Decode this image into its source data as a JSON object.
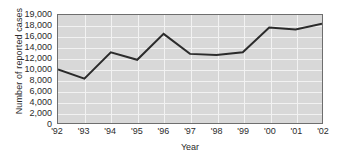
{
  "chart_data": {
    "type": "line",
    "title": "",
    "xlabel": "Year",
    "ylabel": "Number of reported cases",
    "categories": [
      "'92",
      "'93",
      "'94",
      "'95",
      "'96",
      "'97",
      "'98",
      "'99",
      "'00",
      "'01",
      "'02"
    ],
    "values": [
      9900,
      8200,
      13100,
      11700,
      16500,
      12800,
      12600,
      13100,
      17700,
      17300,
      18200
    ],
    "series": [
      {
        "name": "Number of reported cases",
        "values": [
          9900,
          8200,
          13100,
          11700,
          16500,
          12800,
          12600,
          13100,
          17700,
          17300,
          18200
        ]
      }
    ],
    "ytick_labels": [
      "19,000",
      "18,000",
      "16,000",
      "14,000",
      "12,000",
      "10,000",
      "8,000",
      "6,000",
      "4,000",
      "2,000",
      "0"
    ],
    "ytick_values": [
      19000,
      18000,
      16000,
      14000,
      12000,
      10000,
      8000,
      6000,
      4000,
      2000,
      0
    ],
    "ylim": [
      0,
      19000
    ],
    "grid": true,
    "legend": "none",
    "line_color": "#2b2b2b",
    "plot_background": "#d8d8d8",
    "grid_color": "#f2f2f2",
    "frame_color": "#6e6e6e"
  }
}
